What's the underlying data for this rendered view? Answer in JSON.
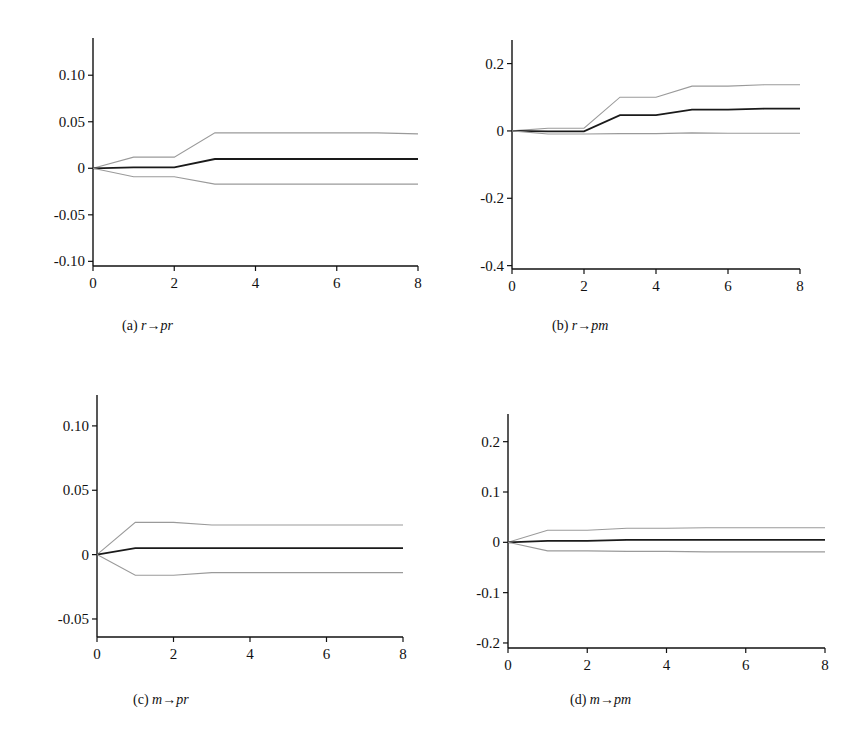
{
  "chart_data": [
    {
      "type": "line",
      "panel": "a",
      "caption_prefix": "(a) ",
      "caption_from": "r",
      "caption_arrow": "→",
      "caption_to": "pr",
      "x": [
        0,
        1,
        2,
        3,
        4,
        5,
        6,
        7,
        8
      ],
      "xticks": [
        0,
        2,
        4,
        6,
        8
      ],
      "xtick_labels": [
        "0",
        "2",
        "4",
        "6",
        "8"
      ],
      "xlim": [
        0,
        8
      ],
      "ylim": [
        -0.105,
        0.14
      ],
      "yticks": [
        0.1,
        0.05,
        0,
        -0.05,
        -0.1
      ],
      "ytick_labels": [
        "0.10",
        "0.05",
        "0",
        "-0.05",
        "-0.10"
      ],
      "series": [
        {
          "name": "upper band",
          "style": "band",
          "values": [
            0,
            0.012,
            0.012,
            0.038,
            0.038,
            0.038,
            0.038,
            0.038,
            0.037
          ]
        },
        {
          "name": "response",
          "style": "response",
          "values": [
            0,
            0.001,
            0.001,
            0.01,
            0.01,
            0.01,
            0.01,
            0.01,
            0.01
          ]
        },
        {
          "name": "lower band",
          "style": "band",
          "values": [
            0,
            -0.009,
            -0.009,
            -0.017,
            -0.017,
            -0.017,
            -0.017,
            -0.017,
            -0.017
          ]
        }
      ]
    },
    {
      "type": "line",
      "panel": "b",
      "caption_prefix": "(b) ",
      "caption_from": "r",
      "caption_arrow": "→",
      "caption_to": "pm",
      "x": [
        0,
        1,
        2,
        3,
        4,
        5,
        6,
        7,
        8
      ],
      "xticks": [
        0,
        2,
        4,
        6,
        8
      ],
      "xtick_labels": [
        "0",
        "2",
        "4",
        "6",
        "8"
      ],
      "xlim": [
        0,
        8
      ],
      "ylim": [
        -0.41,
        0.27
      ],
      "yticks": [
        0.2,
        0,
        -0.2,
        -0.4
      ],
      "ytick_labels": [
        "0.2",
        "0",
        "-0.2",
        "-0.4"
      ],
      "series": [
        {
          "name": "upper band",
          "style": "band",
          "values": [
            0,
            0.008,
            0.008,
            0.1,
            0.1,
            0.133,
            0.133,
            0.137,
            0.137
          ]
        },
        {
          "name": "response",
          "style": "response",
          "values": [
            0,
            -0.001,
            -0.001,
            0.047,
            0.047,
            0.063,
            0.063,
            0.066,
            0.066
          ]
        },
        {
          "name": "lower band",
          "style": "band",
          "values": [
            0,
            -0.009,
            -0.009,
            -0.008,
            -0.008,
            -0.006,
            -0.007,
            -0.007,
            -0.007
          ]
        }
      ]
    },
    {
      "type": "line",
      "panel": "c",
      "caption_prefix": "(c) ",
      "caption_from": "m",
      "caption_arrow": "→",
      "caption_to": "pr",
      "x": [
        0,
        1,
        2,
        3,
        4,
        5,
        6,
        7,
        8
      ],
      "xticks": [
        0,
        2,
        4,
        6,
        8
      ],
      "xtick_labels": [
        "0",
        "2",
        "4",
        "6",
        "8"
      ],
      "xlim": [
        0,
        8
      ],
      "ylim": [
        -0.064,
        0.124
      ],
      "yticks": [
        0.1,
        0.05,
        0,
        -0.05
      ],
      "ytick_labels": [
        "0.10",
        "0.05",
        "0",
        "-0.05"
      ],
      "series": [
        {
          "name": "upper band",
          "style": "band",
          "values": [
            0,
            0.025,
            0.025,
            0.023,
            0.023,
            0.023,
            0.023,
            0.023,
            0.023
          ]
        },
        {
          "name": "response",
          "style": "response",
          "values": [
            0,
            0.005,
            0.005,
            0.005,
            0.005,
            0.005,
            0.005,
            0.005,
            0.005
          ]
        },
        {
          "name": "lower band",
          "style": "band",
          "values": [
            0,
            -0.016,
            -0.016,
            -0.014,
            -0.014,
            -0.014,
            -0.014,
            -0.014,
            -0.014
          ]
        }
      ]
    },
    {
      "type": "line",
      "panel": "d",
      "caption_prefix": "(d) ",
      "caption_from": "m",
      "caption_arrow": "→",
      "caption_to": "pm",
      "x": [
        0,
        1,
        2,
        3,
        4,
        5,
        6,
        7,
        8
      ],
      "xticks": [
        0,
        2,
        4,
        6,
        8
      ],
      "xtick_labels": [
        "0",
        "2",
        "4",
        "6",
        "8"
      ],
      "xlim": [
        0,
        8
      ],
      "ylim": [
        -0.21,
        0.255
      ],
      "yticks": [
        0.2,
        0.1,
        0,
        -0.1,
        -0.2
      ],
      "ytick_labels": [
        "0.2",
        "0.1",
        "0",
        "-0.1",
        "-0.2"
      ],
      "series": [
        {
          "name": "upper band",
          "style": "band",
          "values": [
            0,
            0.024,
            0.024,
            0.028,
            0.028,
            0.029,
            0.029,
            0.029,
            0.029
          ]
        },
        {
          "name": "response",
          "style": "response",
          "values": [
            0,
            0.003,
            0.003,
            0.005,
            0.005,
            0.005,
            0.005,
            0.005,
            0.005
          ]
        },
        {
          "name": "lower band",
          "style": "band",
          "values": [
            0,
            -0.017,
            -0.017,
            -0.018,
            -0.018,
            -0.019,
            -0.019,
            -0.019,
            -0.019
          ]
        }
      ]
    }
  ]
}
